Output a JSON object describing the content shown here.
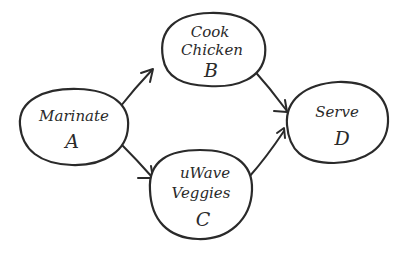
{
  "diagram": {
    "type": "directed-graph",
    "style": "hand-drawn",
    "colors": {
      "ink": "#2a2a2a",
      "background": "#ffffff"
    },
    "nodes": [
      {
        "id": "A",
        "name_lines": [
          "Marinate"
        ],
        "letter": "A"
      },
      {
        "id": "B",
        "name_lines": [
          "Cook",
          "Chicken"
        ],
        "letter": "B"
      },
      {
        "id": "C",
        "name_lines": [
          "uWave",
          "Veggies"
        ],
        "letter": "C"
      },
      {
        "id": "D",
        "name_lines": [
          "Serve"
        ],
        "letter": "D"
      }
    ],
    "edges": [
      {
        "from": "A",
        "to": "B"
      },
      {
        "from": "A",
        "to": "C"
      },
      {
        "from": "B",
        "to": "D"
      },
      {
        "from": "C",
        "to": "D"
      }
    ]
  }
}
